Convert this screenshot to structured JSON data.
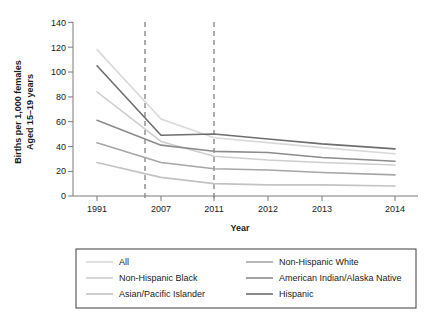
{
  "chart_data": {
    "type": "line",
    "title": "",
    "xlabel": "Year",
    "ylabel": "Births per 1,000 females Aged 15–19 years",
    "ylabel_line1": "Births per 1,000 females",
    "ylabel_line2": "Aged 15–19 years",
    "categories": [
      "1991",
      "2007",
      "2011",
      "2012",
      "2013",
      "2014"
    ],
    "x_tick_labels": [
      "1991",
      "2007",
      "2011",
      "2012",
      "2013",
      "2014"
    ],
    "y_tick_labels": [
      "0",
      "20",
      "40",
      "60",
      "80",
      "100",
      "120",
      "140"
    ],
    "y_ticks": [
      0,
      20,
      40,
      60,
      80,
      100,
      120,
      140
    ],
    "ylim": [
      0,
      140
    ],
    "grid": false,
    "legend_position": "bottom",
    "annotations": [
      {
        "name": "dashed-rule-2006",
        "type": "vline",
        "x_label": "2006"
      },
      {
        "name": "dashed-rule-2011",
        "type": "vline",
        "x_label": "2011"
      }
    ],
    "series": [
      {
        "name": "All",
        "color": "#d9d9d9",
        "values": [
          118,
          62,
          47,
          43,
          39,
          34
        ]
      },
      {
        "name": "Non-Hispanic Black",
        "color": "#cfcfcf",
        "values": [
          84,
          44,
          32,
          29,
          27,
          25
        ]
      },
      {
        "name": "Asian/Pacific Islander",
        "color": "#c2c2c2",
        "values": [
          27,
          15,
          10,
          9,
          9,
          8
        ]
      },
      {
        "name": "Non-Hispanic White",
        "color": "#a6a6a6",
        "values": [
          43,
          27,
          22,
          21,
          19,
          17
        ]
      },
      {
        "name": "American Indian/Alaska Native",
        "color": "#8c8c8c",
        "values": [
          61,
          41,
          36,
          35,
          31,
          28
        ]
      },
      {
        "name": "Hispanic",
        "color": "#6e6e6e",
        "values": [
          105,
          49,
          50,
          46,
          42,
          38
        ]
      }
    ],
    "legend_columns": [
      [
        "All",
        "Non-Hispanic Black",
        "Asian/Pacific Islander"
      ],
      [
        "Non-Hispanic White",
        "American Indian/Alaska Native",
        "Hispanic"
      ]
    ]
  },
  "axis": {
    "y_title_line1": "Births per 1,000 females",
    "y_title_line2": "Aged 15–19 years",
    "x_title": "Year"
  },
  "ticks": {
    "y": [
      "140",
      "120",
      "100",
      "80",
      "60",
      "40",
      "20",
      "0"
    ],
    "x": [
      "1991",
      "2007",
      "2011",
      "2012",
      "2013",
      "2014"
    ]
  },
  "legend": {
    "items": [
      {
        "label": "All",
        "color": "#d9d9d9"
      },
      {
        "label": "Non-Hispanic White",
        "color": "#a6a6a6"
      },
      {
        "label": "Non-Hispanic Black",
        "color": "#cfcfcf"
      },
      {
        "label": "American Indian/Alaska Native",
        "color": "#8c8c8c"
      },
      {
        "label": "Asian/Pacific Islander",
        "color": "#c2c2c2"
      },
      {
        "label": "Hispanic",
        "color": "#6e6e6e"
      }
    ]
  },
  "colors": {
    "axis": "#7a7a7a",
    "text": "#1a1a1a",
    "dashed_rule": "#8a8a8a",
    "legend_border": "#3c3c3c"
  }
}
